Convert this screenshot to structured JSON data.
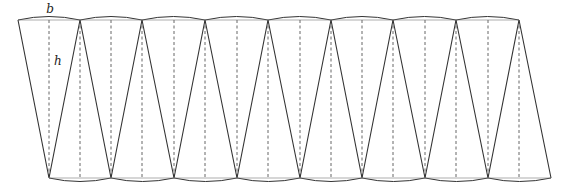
{
  "diagram": {
    "title": "",
    "labels": {
      "base": "b",
      "height": "h"
    },
    "label_positions": {
      "base": [
        50,
        13
      ],
      "height": [
        54,
        65
      ]
    },
    "top_y": 20,
    "bottom_y": 178,
    "arc_bulge": 3.5,
    "top_vertices_x": [
      18,
      80,
      142,
      205,
      268,
      331,
      393,
      456,
      519
    ],
    "bottom_vertices_x": [
      49,
      111,
      174,
      237,
      300,
      362,
      425,
      488,
      551
    ],
    "colors": {
      "stroke": "#333333",
      "dashed": "#555555",
      "background": "#ffffff"
    }
  }
}
